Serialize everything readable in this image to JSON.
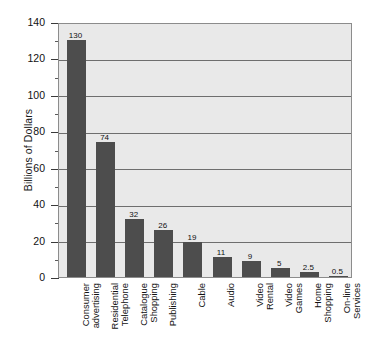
{
  "chart_data": {
    "type": "bar",
    "title": "",
    "xlabel": "",
    "ylabel": "Billions of Dollars",
    "ylim": [
      0,
      140
    ],
    "ytick_step": 20,
    "yminor_step": 10,
    "grid": true,
    "legend": "none",
    "orientation": "vertical",
    "bar_color": "#4d4d4d",
    "plot_background": "#e9e9e9",
    "frame_color": "#8c8c8c",
    "gridline_color": "#6e6e6e",
    "value_labels_shown": true,
    "categories": [
      "Consumer\nadvertising",
      "Residential\nTelephone",
      "Catalogue\nShopping",
      "Publishing",
      "Cable",
      "Audio",
      "Video\nRental",
      "Video\nGames",
      "Home\nShopping",
      "On-line\nServices"
    ],
    "values": [
      130,
      74,
      32,
      26,
      19,
      11,
      9,
      5,
      2.5,
      0.5
    ],
    "value_labels": [
      "130",
      "74",
      "32",
      "26",
      "19",
      "11",
      "9",
      "5",
      "2.5",
      "0.5"
    ],
    "ytick_labels": [
      "0",
      "20",
      "40",
      "60",
      "80",
      "100",
      "120",
      "140"
    ],
    "ytick_values": [
      0,
      20,
      40,
      60,
      80,
      100,
      120,
      140
    ]
  }
}
